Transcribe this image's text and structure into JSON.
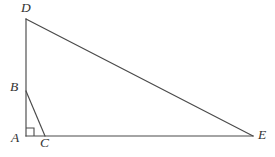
{
  "figure": {
    "kind": "geometry-diagram",
    "background_color": "#ffffff",
    "stroke_color": "#4a4a4a",
    "label_color": "#333333",
    "canvas": {
      "width": 275,
      "height": 157
    },
    "points": {
      "A": {
        "name": "A",
        "x": 26,
        "y": 136,
        "label_x": 11,
        "label_y": 131
      },
      "B": {
        "name": "B",
        "x": 26,
        "y": 91,
        "label_x": 10,
        "label_y": 80
      },
      "C": {
        "name": "C",
        "x": 45,
        "y": 136,
        "label_x": 40,
        "label_y": 136
      },
      "D": {
        "name": "D",
        "x": 26,
        "y": 19,
        "label_x": 21,
        "label_y": 1
      },
      "E": {
        "name": "E",
        "x": 253,
        "y": 136,
        "label_x": 258,
        "label_y": 128
      }
    },
    "segments": [
      {
        "name": "segment-AD",
        "from": "A",
        "to": "D",
        "path": "M 26 136 L 26 19"
      },
      {
        "name": "segment-DE",
        "from": "D",
        "to": "E",
        "path": "M 26 19 L 253 136"
      },
      {
        "name": "segment-AE",
        "from": "A",
        "to": "E",
        "path": "M 26 136 L 253 136"
      },
      {
        "name": "segment-BC",
        "from": "B",
        "to": "C",
        "path": "M 26 91 L 45 136"
      }
    ],
    "right_angle": {
      "name": "right-angle-at-A",
      "at": "A",
      "size": 8,
      "path": "M 26 128 L 34 128 L 34 136"
    },
    "labels": [
      "D",
      "B",
      "A",
      "C",
      "E"
    ]
  }
}
